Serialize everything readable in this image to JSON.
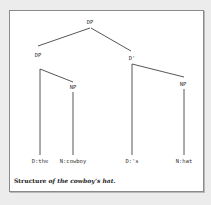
{
  "diagram": {
    "type": "syntax-tree",
    "nodes": {
      "root": {
        "label": "DP",
        "x": 90,
        "y": 20
      },
      "dp_left": {
        "label": "DP",
        "x": 38,
        "y": 53
      },
      "d_bar": {
        "label": "D'",
        "x": 132,
        "y": 56
      },
      "np_left": {
        "label": "NP",
        "x": 73,
        "y": 85
      },
      "np_right": {
        "label": "NP",
        "x": 183,
        "y": 82
      }
    },
    "leaves": [
      {
        "label": "D:the",
        "x": 40,
        "y": 159
      },
      {
        "label": "N:cowboy",
        "x": 73,
        "y": 159
      },
      {
        "label": "D:'s",
        "x": 132,
        "y": 159
      },
      {
        "label": "N:hat",
        "x": 184,
        "y": 159
      }
    ],
    "edges": [
      {
        "from": "DP",
        "to": "DP",
        "x1": 90,
        "y1": 28,
        "x2": 38,
        "y2": 46
      },
      {
        "from": "DP",
        "to": "D'",
        "x1": 91,
        "y1": 28,
        "x2": 131,
        "y2": 51
      },
      {
        "from": "DP",
        "to": "NP",
        "x1": 40,
        "y1": 69,
        "x2": 73,
        "y2": 82
      },
      {
        "from": "DP",
        "to": "D:the",
        "x1": 40,
        "y1": 69,
        "x2": 40,
        "y2": 155
      },
      {
        "from": "NP",
        "to": "N:cowboy",
        "x1": 73,
        "y1": 92,
        "x2": 73,
        "y2": 155
      },
      {
        "from": "D'",
        "to": "NP",
        "x1": 132,
        "y1": 64,
        "x2": 184,
        "y2": 77
      },
      {
        "from": "D'",
        "to": "D:'s",
        "x1": 132,
        "y1": 64,
        "x2": 132,
        "y2": 155
      },
      {
        "from": "NP",
        "to": "N:hat",
        "x1": 184,
        "y1": 89,
        "x2": 184,
        "y2": 155
      }
    ]
  },
  "caption": {
    "lead": "Structure",
    "rest": " of the cowboy’s hat."
  },
  "colors": {
    "background": "#ececec",
    "panel": "#ffffff",
    "border": "#8a8a8a",
    "line": "#444444",
    "text": "#333333"
  }
}
